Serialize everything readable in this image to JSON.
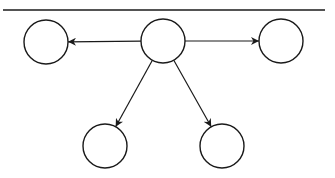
{
  "diagram": {
    "type": "tree",
    "colors": {
      "stroke": "#1a1a1a",
      "fill": "#ffffff",
      "background": "#ffffff"
    },
    "top_rule": {
      "x1": 3,
      "y1": 10,
      "x2": 325,
      "y2": 10
    },
    "nodes": [
      {
        "id": "center",
        "cx": 163,
        "cy": 41,
        "r": 22
      },
      {
        "id": "left",
        "cx": 46,
        "cy": 42,
        "r": 22
      },
      {
        "id": "right",
        "cx": 281,
        "cy": 41,
        "r": 22
      },
      {
        "id": "bottom-left",
        "cx": 105,
        "cy": 146,
        "r": 22
      },
      {
        "id": "bottom-right",
        "cx": 222,
        "cy": 146,
        "r": 22
      }
    ],
    "edges": [
      {
        "from": "center",
        "to": "left",
        "directed": true
      },
      {
        "from": "center",
        "to": "right",
        "directed": true
      },
      {
        "from": "center",
        "to": "bottom-left",
        "directed": true
      },
      {
        "from": "center",
        "to": "bottom-right",
        "directed": true
      }
    ]
  }
}
